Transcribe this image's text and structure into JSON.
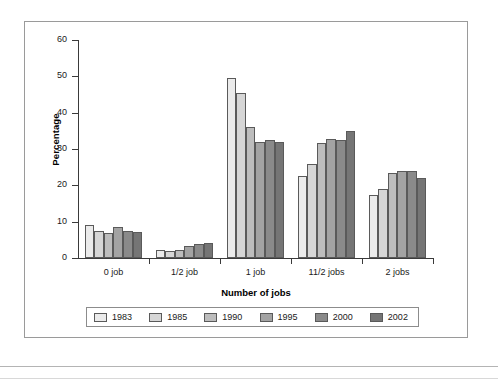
{
  "figure": {
    "y_axis_title": "Percentage",
    "x_axis_title": "Number of jobs"
  },
  "chart_data": {
    "type": "bar",
    "title": "",
    "xlabel": "Number of jobs",
    "ylabel": "Percentage",
    "ylim": [
      0,
      60
    ],
    "yticks": [
      0,
      10,
      20,
      30,
      40,
      50,
      60
    ],
    "grid": false,
    "legend_position": "bottom",
    "categories": [
      "0 job",
      "1/2 job",
      "1 job",
      "11/2 jobs",
      "2 jobs"
    ],
    "series": [
      {
        "name": "1983",
        "color": "#ebebeb",
        "values": [
          9.0,
          2.2,
          49.5,
          22.7,
          17.3
        ]
      },
      {
        "name": "1985",
        "color": "#d6d6d6",
        "values": [
          7.5,
          2.0,
          45.5,
          26.0,
          19.0
        ]
      },
      {
        "name": "1990",
        "color": "#bdbdbd",
        "values": [
          7.0,
          2.2,
          36.0,
          31.7,
          23.5
        ]
      },
      {
        "name": "1995",
        "color": "#a3a3a3",
        "values": [
          8.6,
          3.3,
          32.0,
          32.7,
          24.0
        ]
      },
      {
        "name": "2000",
        "color": "#8a8a8a",
        "values": [
          7.5,
          3.8,
          32.5,
          32.6,
          24.0
        ]
      },
      {
        "name": "2002",
        "color": "#757575",
        "values": [
          7.2,
          4.2,
          31.8,
          35.0,
          22.0
        ]
      }
    ]
  }
}
